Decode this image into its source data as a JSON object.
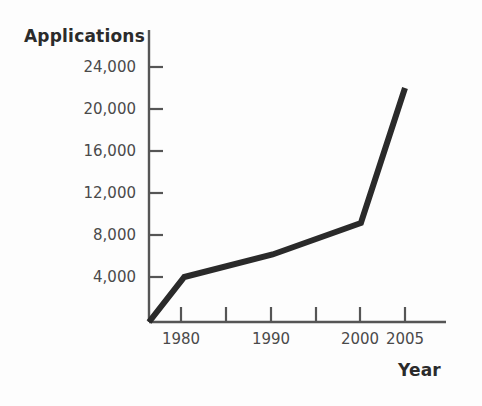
{
  "chart_data": {
    "type": "line",
    "title": "",
    "xlabel": "Year",
    "ylabel": "Applications",
    "x": [
      1976,
      1980,
      1990,
      2000,
      2005
    ],
    "values": [
      0,
      4000,
      6000,
      8800,
      20800
    ],
    "series": [
      {
        "name": "Applications",
        "x": [
          1976,
          1980,
          1990,
          2000,
          2005
        ],
        "values": [
          0,
          4000,
          6000,
          8800,
          20800
        ]
      }
    ],
    "xlim": [
      1975,
      2006.5
    ],
    "ylim": [
      0,
      26000
    ],
    "x_tick_values": [
      1975,
      1980,
      1985,
      1990,
      1995,
      2000,
      2005
    ],
    "x_tick_labels": [
      "1980",
      "1990",
      "2000",
      "2005"
    ],
    "y_tick_labels": [
      "24,000",
      "20,000",
      "16,000",
      "12,000",
      "8,000",
      "4,000"
    ],
    "y_tick_values": [
      24000,
      20000,
      16000,
      12000,
      8000,
      4000
    ],
    "grid": false,
    "legend": "none",
    "line_color": "#2a2a2a",
    "axis_color": "#555555",
    "background_color": "#fdfdfd"
  },
  "axes": {
    "y_title": "Applications",
    "x_title": "Year"
  },
  "y_ticks": [
    {
      "label": "24,000"
    },
    {
      "label": "20,000"
    },
    {
      "label": "16,000"
    },
    {
      "label": "12,000"
    },
    {
      "label": "8,000"
    },
    {
      "label": "4,000"
    }
  ],
  "x_ticks": [
    {
      "label": "1980"
    },
    {
      "label": "1990"
    },
    {
      "label": "2000"
    },
    {
      "label": "2005"
    }
  ]
}
